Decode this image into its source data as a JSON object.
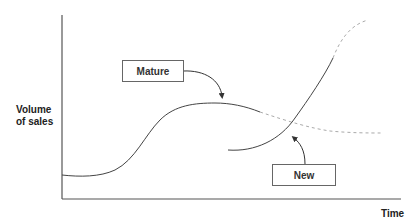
{
  "diagram": {
    "y_axis_label_line1": "Volume",
    "y_axis_label_line2": "of sales",
    "x_axis_label": "Time",
    "boxes": {
      "mature": "Mature",
      "new": "New"
    },
    "colors": {
      "axis": "#555555",
      "curve": "#444444",
      "dashed": "#aaaaaa",
      "box_border": "#666666"
    }
  }
}
